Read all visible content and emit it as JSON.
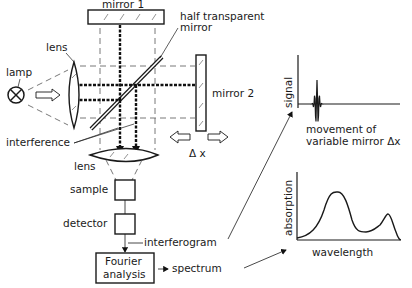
{
  "labels": {
    "mirror1": "mirror 1",
    "half_transparent_line1": "half transparent",
    "half_transparent_line2": "mirror",
    "lens_top": "lens",
    "lamp": "lamp",
    "mirror2": "mirror 2",
    "interference": "interference",
    "delta_x": "Δ x",
    "lens_bottom": "lens",
    "sample": "sample",
    "detector": "detector",
    "interferogram": "interferogram",
    "fourier_line1": "Fourier",
    "fourier_line2": "analysis",
    "spectrum": "spectrum"
  },
  "interferogram_plot": {
    "ylabel": "signal",
    "xlabel_line1": "movement of",
    "xlabel_line2": "variable mirror Δx"
  },
  "spectrum_plot": {
    "ylabel": "absorption",
    "xlabel": "wavelength"
  },
  "colors": {
    "ink": "#1a1a1a",
    "background": "#ffffff"
  }
}
